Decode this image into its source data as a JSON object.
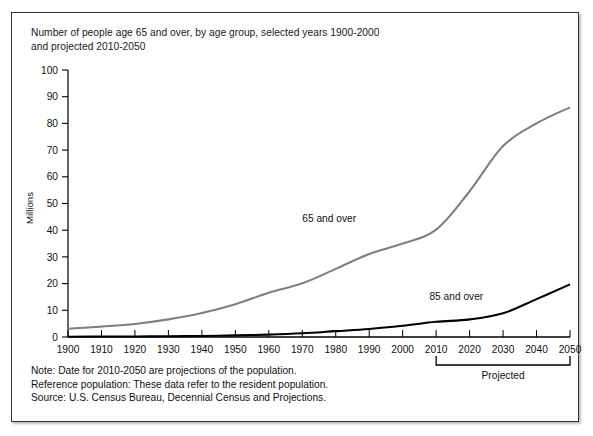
{
  "figure": {
    "title_line1": "Number of people age 65 and over, by age group, selected years 1900-2000",
    "title_line2": "and projected 2010-2050",
    "notes": [
      "Note: Date for 2010-2050 are projections of the population.",
      "Reference population: These data refer to the resident population.",
      "Source: U.S. Census Bureau, Decennial Census and Projections."
    ],
    "projected_bracket_label": "Projected",
    "projected_bracket_from": "2010",
    "projected_bracket_to": "2050",
    "colors": {
      "series_65_and_over": "#808080",
      "series_85_and_over": "#000000",
      "axis": "#000000",
      "frame": "#333333",
      "background": "#ffffff"
    }
  },
  "chart_data": {
    "type": "line",
    "title": "Number of people age 65 and over, by age group, selected years 1900-2000 and projected 2010-2050",
    "xlabel": "",
    "ylabel": "Millions",
    "ylim": [
      0,
      100
    ],
    "xlim": [
      1900,
      2050
    ],
    "ytick_labels": [
      "0",
      "10",
      "20",
      "30",
      "40",
      "50",
      "60",
      "70",
      "80",
      "90",
      "100"
    ],
    "ytick_values": [
      0,
      10,
      20,
      30,
      40,
      50,
      60,
      70,
      80,
      90,
      100
    ],
    "xtick_labels": [
      "1900",
      "1910",
      "1920",
      "1930",
      "1940",
      "1950",
      "1960",
      "1970",
      "1980",
      "1990",
      "2000",
      "2010",
      "2020",
      "2030",
      "2040",
      "2050"
    ],
    "x": [
      1900,
      1910,
      1920,
      1930,
      1940,
      1950,
      1960,
      1970,
      1980,
      1990,
      2000,
      2010,
      2020,
      2030,
      2040,
      2050
    ],
    "grid": false,
    "legend_position": "inline-annotations",
    "series": [
      {
        "name": "65 and over",
        "color": "#808080",
        "values": [
          3.1,
          3.9,
          4.9,
          6.6,
          9.0,
          12.3,
          16.6,
          20.1,
          25.5,
          31.1,
          35.0,
          40.2,
          54.6,
          71.5,
          80.0,
          86.0
        ]
      },
      {
        "name": "85 and over",
        "color": "#000000",
        "values": [
          0.1,
          0.2,
          0.2,
          0.3,
          0.4,
          0.6,
          0.9,
          1.4,
          2.2,
          3.0,
          4.2,
          5.7,
          6.6,
          8.9,
          14.2,
          19.7
        ]
      }
    ],
    "annotations": [
      {
        "text": "65 and over",
        "x": 1970,
        "y": 43
      },
      {
        "text": "85 and over",
        "x": 2008,
        "y": 14
      },
      {
        "text": "Projected",
        "x": 2030,
        "y": -14
      }
    ]
  }
}
